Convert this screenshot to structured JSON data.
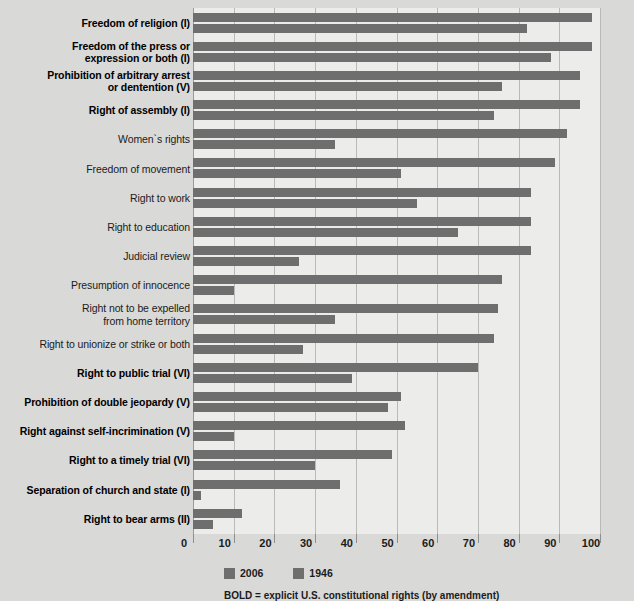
{
  "chart_data": {
    "type": "bar",
    "orientation": "horizontal",
    "title": "",
    "subtitle": "",
    "xlabel": "",
    "ylabel": "",
    "xlim": [
      0,
      100
    ],
    "xticks": [
      0,
      10,
      20,
      30,
      40,
      50,
      60,
      70,
      80,
      90,
      100
    ],
    "grid": true,
    "legend_position": "bottom-left",
    "bar_color": "#6e6e6e",
    "plot_background": "#ececeb",
    "page_background": "#d9d9d7",
    "footnote": "BOLD = explicit U.S. constitutional rights (by amendment)",
    "legend": [
      {
        "name": "2006",
        "color": "#6e6e6e"
      },
      {
        "name": "1946",
        "color": "#6e6e6e"
      }
    ],
    "categories": [
      "Freedom of religion (I)",
      "Freedom of the press or expression or both (I)",
      "Prohibition of arbitrary arrest or dentention (V)",
      "Right of assembly (I)",
      "Women`s rights",
      "Freedom of movement",
      "Right to work",
      "Right to education",
      "Judicial review",
      "Presumption of innocence",
      "Right not to be expelled from home territory",
      "Right to unionize or strike or both",
      "Right to public trial (VI)",
      "Prohibition of double jeopardy (V)",
      "Right against self-incrimination (V)",
      "Right to a timely trial (VI)",
      "Separation of church and state (I)",
      "Right to bear arms (II)"
    ],
    "series": [
      {
        "name": "2006",
        "values": [
          98,
          98,
          95,
          95,
          92,
          89,
          83,
          83,
          83,
          76,
          75,
          74,
          70,
          51,
          52,
          49,
          36,
          12
        ]
      },
      {
        "name": "1946",
        "values": [
          82,
          88,
          76,
          74,
          35,
          51,
          55,
          65,
          26,
          10,
          35,
          27,
          39,
          48,
          10,
          30,
          2,
          5
        ]
      }
    ]
  },
  "rows": [
    {
      "label_lines": [
        "Freedom of religion (I)"
      ],
      "bold": true,
      "v2006": 98,
      "v1946": 82
    },
    {
      "label_lines": [
        "Freedom of the press or",
        "expression or both (I)"
      ],
      "bold": true,
      "v2006": 98,
      "v1946": 88
    },
    {
      "label_lines": [
        "Prohibition of arbitrary arrest",
        "or dentention (V)"
      ],
      "bold": true,
      "v2006": 95,
      "v1946": 76
    },
    {
      "label_lines": [
        "Right of assembly (I)"
      ],
      "bold": true,
      "v2006": 95,
      "v1946": 74
    },
    {
      "label_lines": [
        "Women`s rights"
      ],
      "bold": false,
      "v2006": 92,
      "v1946": 35
    },
    {
      "label_lines": [
        "Freedom of movement"
      ],
      "bold": false,
      "v2006": 89,
      "v1946": 51
    },
    {
      "label_lines": [
        "Right to work"
      ],
      "bold": false,
      "v2006": 83,
      "v1946": 55
    },
    {
      "label_lines": [
        "Right to education"
      ],
      "bold": false,
      "v2006": 83,
      "v1946": 65
    },
    {
      "label_lines": [
        "Judicial review"
      ],
      "bold": false,
      "v2006": 83,
      "v1946": 26
    },
    {
      "label_lines": [
        "Presumption of innocence"
      ],
      "bold": false,
      "v2006": 76,
      "v1946": 10
    },
    {
      "label_lines": [
        "Right not to be expelled",
        "from home territory"
      ],
      "bold": false,
      "v2006": 75,
      "v1946": 35
    },
    {
      "label_lines": [
        "Right to unionize or strike or both"
      ],
      "bold": false,
      "v2006": 74,
      "v1946": 27
    },
    {
      "label_lines": [
        "Right to public trial (VI)"
      ],
      "bold": true,
      "v2006": 70,
      "v1946": 39
    },
    {
      "label_lines": [
        "Prohibition of double jeopardy (V)"
      ],
      "bold": true,
      "v2006": 51,
      "v1946": 48
    },
    {
      "label_lines": [
        "Right against self-incrimination (V)"
      ],
      "bold": true,
      "v2006": 52,
      "v1946": 10
    },
    {
      "label_lines": [
        "Right to a timely trial (VI)"
      ],
      "bold": true,
      "v2006": 49,
      "v1946": 30
    },
    {
      "label_lines": [
        "Separation of church and state (I)"
      ],
      "bold": true,
      "v2006": 36,
      "v1946": 2
    },
    {
      "label_lines": [
        "Right to bear arms (II)"
      ],
      "bold": true,
      "v2006": 12,
      "v1946": 5
    }
  ]
}
